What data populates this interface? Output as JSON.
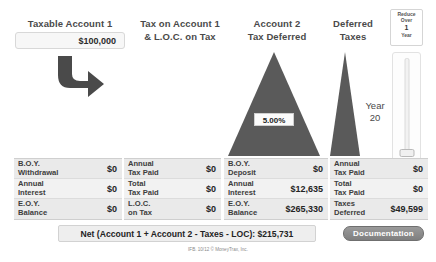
{
  "columns": {
    "account1": {
      "title_line1": "Taxable Account 1",
      "input_value": "$100,000"
    },
    "tax_on_account1": {
      "title_line1": "Tax on Account 1",
      "title_line2": "& L.O.C. on Tax"
    },
    "account2": {
      "title_line1": "Account 2",
      "title_line2": "Tax Deferred",
      "rate_value": "5.00%"
    },
    "deferred_taxes": {
      "title_line1": "Deferred",
      "title_line2": "Taxes",
      "year_label_line1": "Year",
      "year_label_line2": "20"
    }
  },
  "reduce_over": {
    "line1": "Reduce",
    "line2": "Over",
    "value": "1",
    "line3": "Year"
  },
  "tables": [
    {
      "name": "account1-table",
      "rows": [
        {
          "label": "B.O.Y.\nWithdrawal",
          "value": "$0"
        },
        {
          "label": "Annual\nInterest",
          "value": "$0"
        },
        {
          "label": "E.O.Y.\nBalance",
          "value": "$0"
        }
      ]
    },
    {
      "name": "tax-on-account1-table",
      "rows": [
        {
          "label": "Annual\nTax Paid",
          "value": "$0"
        },
        {
          "label": "Total\nTax Paid",
          "value": "$0"
        },
        {
          "label": "L.O.C.\non Tax",
          "value": "$0"
        }
      ]
    },
    {
      "name": "account2-table",
      "rows": [
        {
          "label": "B.O.Y.\nDeposit",
          "value": "$0"
        },
        {
          "label": "Annual\nInterest",
          "value": "$12,635"
        },
        {
          "label": "E.O.Y.\nBalance",
          "value": "$265,330"
        }
      ]
    },
    {
      "name": "deferred-taxes-table",
      "rows": [
        {
          "label": "Annual\nTax Paid",
          "value": "$0"
        },
        {
          "label": "Total\nTax Paid",
          "value": "$0"
        },
        {
          "label": "Taxes\nDeferred",
          "value": "$49,599"
        }
      ]
    }
  ],
  "net_bar": {
    "text": "Net (Account 1 + Account 2 - Taxes - LOC): $215,731"
  },
  "documentation_button": {
    "label": "Documentation"
  },
  "footer": {
    "copyright": "IFB. 10/12 © MoneyTrax, Inc."
  },
  "colors": {
    "triangle_fill": "#5a5a5a",
    "arrow_fill": "#4a4a4a",
    "row_alt": "#eaeaea",
    "row_plain": "#f2f2f2",
    "net_bar_bg": "#eeeeee",
    "doc_button_bg": "#8a8a8a"
  }
}
